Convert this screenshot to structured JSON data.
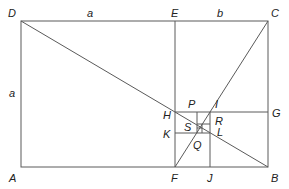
{
  "diagram": {
    "points": {
      "D": "D",
      "E": "E",
      "C": "C",
      "A": "A",
      "F": "F",
      "J": "J",
      "B": "B",
      "H": "H",
      "G": "G",
      "K": "K",
      "P": "P",
      "I": "I",
      "R": "R",
      "S": "S",
      "L": "L",
      "Q": "Q"
    },
    "lengths": {
      "top_left": "a",
      "top_right": "b",
      "left_side": "a"
    },
    "colors": {
      "line": "#5a5a5a",
      "label": "#222222",
      "background": "#ffffff"
    }
  }
}
